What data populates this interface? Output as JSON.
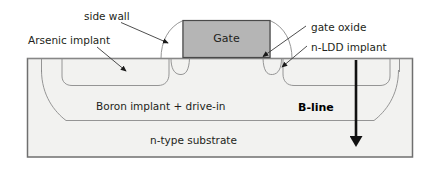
{
  "figure": {
    "colors": {
      "substrate_fill": "#f2f2f0",
      "gate_fill": "#b5b5b5",
      "outline": "#6f6f6f",
      "thin_outline": "#8a8a8a",
      "text": "#231f20",
      "bline": "#111111"
    }
  },
  "labels": {
    "side_wall": "side wall",
    "arsenic_implant": "Arsenic implant",
    "gate": "Gate",
    "gate_oxide": "gate oxide",
    "n_ldd_implant": "n-LDD implant",
    "boron_implant": "Boron implant + drive-in",
    "b_line": "B-line",
    "n_type_substrate": "n-type substrate"
  },
  "regions": [
    {
      "name": "gate-electrode",
      "label": "Gate",
      "fill": "#b5b5b5"
    },
    {
      "name": "arsenic-implant-well",
      "label": "Arsenic implant"
    },
    {
      "name": "n-ldd-implant-well",
      "label": "n-LDD implant"
    },
    {
      "name": "boron-implant-layer",
      "label": "Boron implant + drive-in"
    },
    {
      "name": "n-type-substrate-body",
      "label": "n-type substrate"
    },
    {
      "name": "side-wall-spacer",
      "label": "side wall"
    },
    {
      "name": "gate-oxide-layer",
      "label": "gate oxide"
    }
  ],
  "annotations": [
    {
      "name": "side-wall-leader",
      "target": "side-wall-spacer"
    },
    {
      "name": "arsenic-implant-leader",
      "target": "arsenic-implant-well"
    },
    {
      "name": "gate-oxide-leader",
      "target": "gate-oxide-layer"
    },
    {
      "name": "n-ldd-implant-leader",
      "target": "n-ldd-implant-well"
    },
    {
      "name": "b-line-arrow",
      "target": "n-type-substrate-body",
      "direction": "down"
    }
  ]
}
